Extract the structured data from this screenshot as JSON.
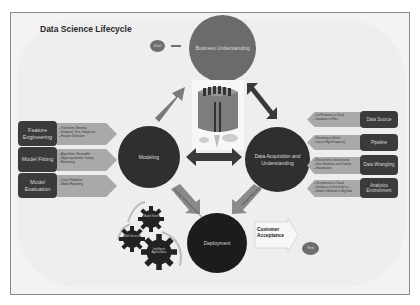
{
  "title": "Data Science Lifecycle",
  "nodes": {
    "start": "Start",
    "end": "End",
    "business": "Business Understanding",
    "modeling": "Modeling",
    "data": "Data Acquisition and Understanding",
    "deployment": "Deployment",
    "customer_acceptance": "Customer Acceptance"
  },
  "modeling_steps": [
    {
      "label": "Feature Engineering",
      "bullets": [
        "Transform, Binning",
        "Temporal, Text, Image etc.",
        "Feature Selection"
      ]
    },
    {
      "label": "Model Fitting",
      "bullets": [
        "Algorithms, Ensemble",
        "Hyper-parameter Tuning",
        "Retraining"
      ]
    },
    {
      "label": "Model Evaluation",
      "bullets": [
        "Cross Validation",
        "Model Reporting"
      ]
    }
  ],
  "data_steps": [
    {
      "label": "Data Source",
      "bullets": [
        "On-Premises vs Cloud",
        "Database vs Files"
      ]
    },
    {
      "label": "Pipeline",
      "bullets": [
        "Streaming vs Batch",
        "Low vs High Frequency"
      ]
    },
    {
      "label": "Data Wrangling",
      "bullets": [
        "Structured vs Unstructured",
        "Data Validation and Cleanup",
        "Visualization"
      ]
    },
    {
      "label": "Analytics Environment",
      "bullets": [
        "On-premises vs Cloud",
        "Database vs Data Lake vs ...",
        "Small vs Medium vs Big Data"
      ]
    }
  ],
  "deployment_arrows": {
    "left": "Scoring, Performance monitoring, etc.",
    "right": "Intelligent Applications"
  },
  "gears": [
    "Model Store",
    "Web Services",
    "Intelligent Applications"
  ],
  "colors": {
    "dark": "#2f2f2f",
    "mid": "#6b6b6b",
    "arrow": "#a9a9a9",
    "background": "#eeeeee"
  }
}
